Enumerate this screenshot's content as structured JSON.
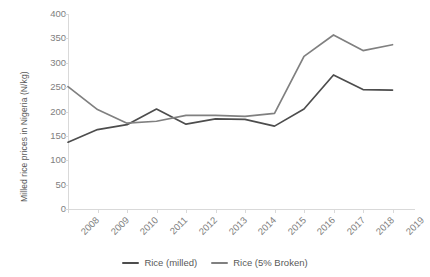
{
  "chart_data": {
    "type": "line",
    "title": "",
    "xlabel": "",
    "ylabel": "Milled rice prices in Nigeria (N/kg)",
    "categories": [
      "2008",
      "2009",
      "2010",
      "2011",
      "2012",
      "2013",
      "2014",
      "2015",
      "2016",
      "2017",
      "2018",
      "2019"
    ],
    "ylim": [
      0,
      400
    ],
    "ytick_step": 50,
    "yticks": [
      "0",
      "50",
      "100",
      "150",
      "200",
      "250",
      "300",
      "350",
      "400"
    ],
    "grid": false,
    "legend_position": "bottom",
    "series": [
      {
        "name": "Rice (milled)",
        "color": "#4d4d4d",
        "values": [
          137,
          163,
          173,
          205,
          174,
          185,
          184,
          170,
          205,
          275,
          245,
          244
        ]
      },
      {
        "name": "Rice (5% Broken)",
        "color": "#808080",
        "values": [
          251,
          204,
          176,
          180,
          192,
          192,
          190,
          196,
          313,
          357,
          325,
          337
        ]
      }
    ]
  },
  "legend": {
    "items": [
      {
        "label": "Rice (milled)"
      },
      {
        "label": "Rice (5% Broken)"
      }
    ]
  }
}
